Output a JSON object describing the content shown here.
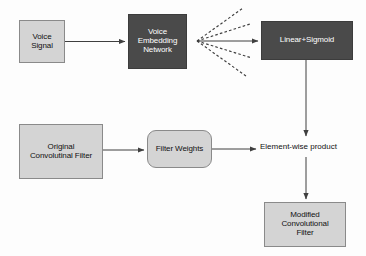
{
  "diagram": {
    "background_color": "#fdfdfd",
    "node_light_fill": "#d4d4d4",
    "node_dark_fill": "#4a4a4a",
    "stroke_color": "#444444",
    "nodes": {
      "voice_signal": {
        "label": "Voice\nSignal",
        "line1": "Voice",
        "line2": "Signal",
        "style": "light"
      },
      "voice_embedding_network": {
        "line1": "Voice",
        "line2": "Embedding",
        "line3": "Network",
        "style": "dark"
      },
      "linear_sigmoid": {
        "label": "Linear+Sigmoid",
        "style": "dark"
      },
      "original_convolutional_filter": {
        "line1": "Original",
        "line2": "Convolutinal Filter",
        "style": "light"
      },
      "filter_weights": {
        "label": "Filter Weights",
        "style": "light-rounded"
      },
      "modified_convolutional_filter": {
        "line1": "Modified",
        "line2": "Convolutional",
        "line3": "Filter",
        "style": "light"
      }
    },
    "labels": {
      "elementwise_product": "Element-wise product"
    },
    "edges": [
      {
        "from": "voice_signal",
        "to": "voice_embedding_network",
        "style": "solid-arrow"
      },
      {
        "from": "voice_embedding_network",
        "to": "linear_sigmoid",
        "style": "solid-arrow"
      },
      {
        "from": "voice_embedding_network",
        "to": "fan-out-1",
        "style": "dashed"
      },
      {
        "from": "voice_embedding_network",
        "to": "fan-out-2",
        "style": "dashed"
      },
      {
        "from": "voice_embedding_network",
        "to": "fan-out-3",
        "style": "dashed"
      },
      {
        "from": "voice_embedding_network",
        "to": "fan-out-4",
        "style": "dashed"
      },
      {
        "from": "linear_sigmoid",
        "to": "elementwise_product",
        "style": "solid-arrow"
      },
      {
        "from": "original_convolutional_filter",
        "to": "filter_weights",
        "style": "solid-arrow"
      },
      {
        "from": "filter_weights",
        "to": "elementwise_product",
        "style": "solid-arrow"
      },
      {
        "from": "elementwise_product",
        "to": "modified_convolutional_filter",
        "style": "solid-arrow"
      }
    ]
  }
}
